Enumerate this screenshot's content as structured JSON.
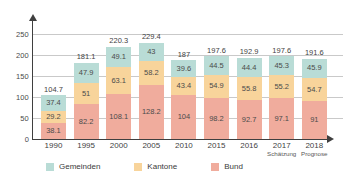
{
  "chart_data": {
    "type": "bar",
    "stacked": true,
    "title": "",
    "subtitle": "",
    "xlabel": "",
    "ylabel": "",
    "ylim": [
      0,
      250
    ],
    "yticks": [
      0,
      50,
      100,
      150,
      200,
      250
    ],
    "grid": true,
    "legend_position": "bottom",
    "categories": [
      "1990",
      "1995",
      "2000",
      "2005",
      "2010",
      "2015",
      "2016",
      "2017",
      "2018"
    ],
    "category_sublabels": [
      "",
      "",
      "",
      "",
      "",
      "",
      "",
      "Schätzung",
      "Prognose"
    ],
    "series": [
      {
        "name": "Gemeinden",
        "color": "#b9dcd6",
        "values": [
          37.4,
          47.9,
          49.1,
          43,
          39.6,
          44.5,
          44.4,
          45.3,
          45.9
        ]
      },
      {
        "name": "Kantone",
        "color": "#f8d49b",
        "values": [
          29.2,
          51,
          63.1,
          58.2,
          43.4,
          54.9,
          55.8,
          55.2,
          54.7
        ]
      },
      {
        "name": "Bund",
        "color": "#f0ac9d",
        "values": [
          38.1,
          82.2,
          108.1,
          128.2,
          104,
          98.2,
          92.7,
          97.1,
          91
        ]
      }
    ],
    "totals": [
      "104.7",
      "181.1",
      "220.3",
      "229.4",
      "187",
      "197.6",
      "192.9",
      "197.6",
      "191.6"
    ],
    "segment_labels": {
      "gemeinden": [
        "37.4",
        "47.9",
        "49.1",
        "43",
        "39.6",
        "44.5",
        "44.4",
        "45.3",
        "45.9"
      ],
      "kantone": [
        "29.2",
        "51",
        "63.1",
        "58.2",
        "43.4",
        "54.9",
        "55.8",
        "55.2",
        "54.7"
      ],
      "bund": [
        "38.1",
        "82.2",
        "108.1",
        "128.2",
        "104",
        "98.2",
        "92.7",
        "97.1",
        "91"
      ]
    }
  },
  "axis": {
    "yticks": [
      "250",
      "200",
      "150",
      "100",
      "50",
      "0"
    ]
  },
  "legend": {
    "items": [
      {
        "label": "Gemeinden"
      },
      {
        "label": "Kantone"
      },
      {
        "label": "Bund"
      }
    ]
  }
}
